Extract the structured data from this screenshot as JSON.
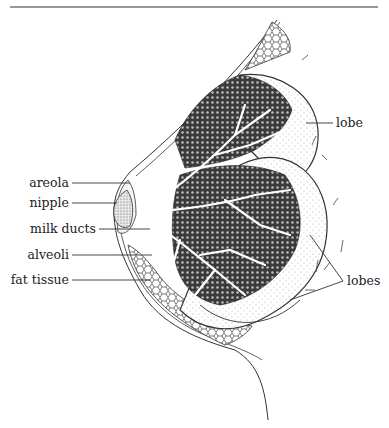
{
  "diagram": {
    "labels_left": [
      {
        "id": "areola",
        "text": "areola"
      },
      {
        "id": "nipple",
        "text": "nipple"
      },
      {
        "id": "milk-ducts",
        "text": "milk ducts"
      },
      {
        "id": "alveoli",
        "text": "alveoli"
      },
      {
        "id": "fat-tissue",
        "text": "fat tissue"
      }
    ],
    "labels_right": [
      {
        "id": "lobe",
        "text": "lobe"
      },
      {
        "id": "lobes",
        "text": "lobes"
      }
    ],
    "colors": {
      "line": "#333333",
      "tissue": "#3a3a3a",
      "background": "#ffffff"
    }
  }
}
